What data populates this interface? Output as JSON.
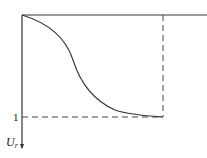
{
  "diagram": {
    "axis_label_main": "U",
    "axis_label_sub": "r",
    "tick_label": "1",
    "line_color": "#333333"
  }
}
